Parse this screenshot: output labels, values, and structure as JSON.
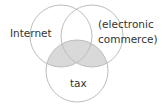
{
  "diagram": {
    "type": "venn",
    "sets": [
      {
        "id": "internet",
        "label": "Internet"
      },
      {
        "id": "ecommerce",
        "label_line1": "(electronic",
        "label_line2": "commerce)"
      },
      {
        "id": "tax",
        "label": "tax"
      }
    ],
    "shaded_regions": [
      "internet∩tax",
      "ecommerce∩tax"
    ],
    "colors": {
      "stroke": "#bdbdbd",
      "shade": "#d9d9d9",
      "text": "#333333",
      "background": "#ffffff"
    }
  }
}
